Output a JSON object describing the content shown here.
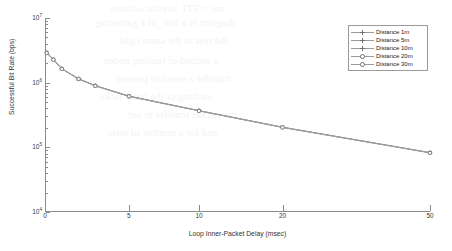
{
  "chart_data": {
    "type": "line",
    "title": "",
    "xlabel": "Loop Inner-Packet Delay (msec)",
    "ylabel": "Successful Bit Rate (bps)",
    "xscale": "nonlinear-compressed",
    "yscale": "log",
    "xlim": [
      0,
      50
    ],
    "ylim": [
      10000,
      10000000
    ],
    "grid": false,
    "legend_position": "upper-right",
    "xticks": [
      0,
      5,
      10,
      20,
      50
    ],
    "xtick_labels": [
      "0",
      "5",
      "10",
      "20",
      "50"
    ],
    "yticks": [
      10000,
      100000,
      1000000,
      10000000
    ],
    "ytick_labels": [
      "10",
      "10",
      "10",
      "10"
    ],
    "ytick_exponents": [
      "4",
      "5",
      "6",
      "7"
    ],
    "x": [
      0.1,
      0.5,
      1,
      2,
      3,
      5,
      10,
      20,
      50
    ],
    "series": [
      {
        "name": "Distance 1m",
        "marker": "cross",
        "values": [
          2950000,
          2300000,
          1650000,
          1150000,
          900000,
          620000,
          370000,
          205000,
          83000
        ]
      },
      {
        "name": "Distance 5m",
        "marker": "plus",
        "values": [
          2930000,
          2290000,
          1645000,
          1148000,
          898000,
          618000,
          369000,
          204500,
          82800
        ]
      },
      {
        "name": "Distance 10m",
        "marker": "star",
        "values": [
          2910000,
          2280000,
          1640000,
          1145000,
          896000,
          617000,
          368000,
          204000,
          82600
        ]
      },
      {
        "name": "Distance 20m",
        "marker": "dot",
        "values": [
          2890000,
          2270000,
          1635000,
          1142000,
          894000,
          616000,
          367000,
          203500,
          82400
        ]
      },
      {
        "name": "Distance 30m",
        "marker": "circ",
        "values": [
          2870000,
          2260000,
          1630000,
          1140000,
          892000,
          615000,
          366000,
          203000,
          82200
        ]
      }
    ],
    "colors": {
      "line": "#9b9b9b",
      "marker": "#6e6e7d",
      "axis": "#8a8a8a",
      "text": "#333333"
    }
  },
  "legend": {
    "entries": [
      {
        "label": "Distance 1m"
      },
      {
        "label": "Distance 5m"
      },
      {
        "label": "Distance 10m"
      },
      {
        "label": "Distance 20m"
      },
      {
        "label": "Distance 30m"
      }
    ]
  },
  "axes": {
    "x_title": "Loop Inner-Packet Delay (msec)",
    "y_title": "Successful Bit Rate (bps)"
  },
  "bleed_text": [
    "me = TTL  in  ethic-solvers",
    "diagram is a low_of a gathering",
    "the  rest  in  the  same  light",
    "a  second  of  reading  nodes",
    "transfer  a  sensible  present",
    "eaching  of  the  basic  tasks",
    "the  packet  transfer  in  net",
    "and  for  a  number  of  tests"
  ]
}
